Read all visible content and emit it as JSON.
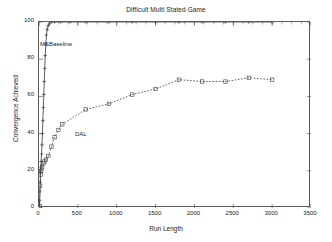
{
  "chart_data": {
    "type": "line",
    "title": "Difficult Multi Stated Game",
    "xlabel": "Run Length",
    "ylabel": "Convergence Achieved",
    "xlim": [
      0,
      3500
    ],
    "ylim": [
      0,
      100
    ],
    "xticks": [
      0,
      500,
      1000,
      1500,
      2000,
      2500,
      3000,
      3500
    ],
    "yticks": [
      0,
      20,
      40,
      60,
      80,
      100
    ],
    "grid": false,
    "legend_position": "inline-annotations",
    "annotations": [
      {
        "text": "MSBaseline",
        "x": 110,
        "y": 88
      },
      {
        "text": "DAL",
        "x": 660,
        "y": 46
      }
    ],
    "series": [
      {
        "name": "MSBaseline",
        "marker": "plus",
        "linestyle": "solid",
        "points": [
          [
            5,
            2
          ],
          [
            8,
            4
          ],
          [
            12,
            9
          ],
          [
            16,
            14
          ],
          [
            20,
            19
          ],
          [
            24,
            22
          ],
          [
            28,
            25
          ],
          [
            33,
            29
          ],
          [
            38,
            34
          ],
          [
            44,
            40
          ],
          [
            50,
            47
          ],
          [
            56,
            54
          ],
          [
            62,
            61
          ],
          [
            68,
            68
          ],
          [
            74,
            75
          ],
          [
            80,
            82
          ],
          [
            88,
            88
          ],
          [
            96,
            93
          ],
          [
            105,
            96
          ],
          [
            118,
            98
          ],
          [
            135,
            99
          ],
          [
            160,
            100
          ],
          [
            200,
            100
          ],
          [
            280,
            100
          ],
          [
            400,
            100
          ],
          [
            600,
            100
          ],
          [
            900,
            100
          ],
          [
            1200,
            100
          ],
          [
            1500,
            100
          ],
          [
            1800,
            100
          ],
          [
            2100,
            100
          ],
          [
            2400,
            100
          ],
          [
            2700,
            100
          ],
          [
            3000,
            100
          ]
        ]
      },
      {
        "name": "DAL",
        "marker": "square",
        "linestyle": "dotted",
        "points": [
          [
            8,
            1
          ],
          [
            15,
            12
          ],
          [
            22,
            18
          ],
          [
            30,
            20
          ],
          [
            40,
            22
          ],
          [
            55,
            24
          ],
          [
            70,
            25
          ],
          [
            90,
            26
          ],
          [
            120,
            28
          ],
          [
            160,
            33
          ],
          [
            200,
            38
          ],
          [
            250,
            42
          ],
          [
            300,
            45
          ],
          [
            600,
            53
          ],
          [
            900,
            56
          ],
          [
            1200,
            61
          ],
          [
            1500,
            64
          ],
          [
            1800,
            69
          ],
          [
            2100,
            68
          ],
          [
            2400,
            68
          ],
          [
            2700,
            70
          ],
          [
            3000,
            69
          ]
        ]
      }
    ]
  },
  "chart": {
    "title": "Difficult Multi Stated Game",
    "xlabel": "Run Length",
    "ylabel": "Convergence Achieved",
    "annot_baseline": "MSBaseline",
    "annot_dal": "DAL",
    "xticks": [
      "0",
      "500",
      "1000",
      "1500",
      "2000",
      "2500",
      "3000",
      "3500"
    ],
    "yticks": [
      "0",
      "20",
      "40",
      "60",
      "80",
      "100"
    ],
    "line_color": "#3a3a3a",
    "axis_color": "#5a5a5a"
  }
}
